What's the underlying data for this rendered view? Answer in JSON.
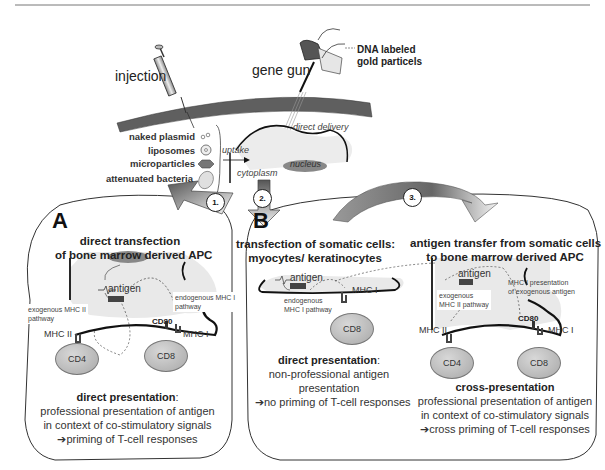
{
  "delivery": {
    "injection_label": "injection",
    "gene_gun_label": "gene gun",
    "gold_particles_label_line1": "DNA labeled",
    "gold_particles_label_line2": "gold particels",
    "direct_delivery_label": "direct delivery",
    "uptake_label": "uptake",
    "cytoplasm_label": "cytoplasm",
    "nucleus_label": "nucleus",
    "vehicles": [
      {
        "label": "naked plasmid",
        "icon": "plasmid-icon"
      },
      {
        "label": "liposomes",
        "icon": "liposome-icon"
      },
      {
        "label": "microparticles",
        "icon": "microparticle-icon"
      },
      {
        "label": "attenuated bacteria",
        "icon": "bacteria-icon"
      }
    ]
  },
  "panel_a": {
    "letter": "A",
    "step": "1.",
    "title_line1": "direct transfection",
    "title_line2": "of bone marrow derived APC",
    "antigen_label": "antigen",
    "exo_pathway_line1": "exogenous MHC II",
    "exo_pathway_line2": "pathway",
    "endo_pathway_line1": "endogenous MHC I",
    "endo_pathway_line2": "pathway",
    "cd80": "CD80",
    "mhc2": "MHC II",
    "mhc1": "MHC I",
    "cd4": "CD4",
    "cd8": "CD8",
    "caption_bold": "direct presentation",
    "caption_colon": ":",
    "caption_line2": "professional presentation of antigen",
    "caption_line3": "in context of co-stimulatory signals",
    "caption_line4": "➔priming of T-cell responses"
  },
  "panel_b": {
    "letter": "B",
    "step2": "2.",
    "step3": "3.",
    "left": {
      "title_line1": "transfection of somatic cells:",
      "title_line2": "myocytes/ keratinocytes",
      "antigen_label": "antigen",
      "endo_line1": "endogenous",
      "endo_line2": "MHC I pathway",
      "mhc1": "MHC I",
      "cd8": "CD8",
      "caption_bold": "direct presentation",
      "caption_colon": ":",
      "caption_line2": "non-professional antigen",
      "caption_line3": "presentation",
      "caption_line4": "➔no priming of T-cell responses"
    },
    "right": {
      "title_line1": "antigen transfer from somatic cells",
      "title_line2": "to bone marrow derived APC",
      "antigen_label": "antigen",
      "exo_line1": "exogenous",
      "exo_line2": "MHC II pathway",
      "mhc1_pres_line1": "MHC I presentation",
      "mhc1_pres_line2": "of exogenous antigen",
      "cd80": "CD80",
      "mhc2": "MHC II",
      "mhc1": "MHC I",
      "cd4": "CD4",
      "cd8": "CD8",
      "caption_bold": "cross-presentation",
      "caption_line2": "professional presentation of antigen",
      "caption_line3": "in context of co-stimulatory signals",
      "caption_line4": "➔cross priming of T-cell responses"
    }
  }
}
